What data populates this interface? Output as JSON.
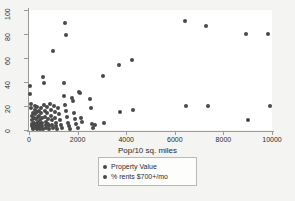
{
  "chart_data": {
    "type": "scatter",
    "title": "",
    "xlabel": "Pop/10 sq. miles",
    "ylabel": "",
    "xlim": [
      0,
      10000
    ],
    "ylim": [
      0,
      100
    ],
    "xticks": [
      0,
      2000,
      4000,
      6000,
      8000,
      10000
    ],
    "yticks": [
      0,
      20,
      40,
      60,
      80,
      100
    ],
    "grid": false,
    "legend_position": "bottom-center",
    "marker_color": "#494949",
    "series": [
      {
        "name": "Property Value",
        "points": [
          [
            40,
            37
          ],
          [
            60,
            30
          ],
          [
            90,
            22
          ],
          [
            100,
            18
          ],
          [
            110,
            12
          ],
          [
            120,
            8
          ],
          [
            130,
            5
          ],
          [
            140,
            3
          ],
          [
            150,
            2
          ],
          [
            160,
            1
          ],
          [
            180,
            14
          ],
          [
            190,
            10
          ],
          [
            200,
            6
          ],
          [
            210,
            4
          ],
          [
            220,
            2
          ],
          [
            240,
            20
          ],
          [
            250,
            17
          ],
          [
            260,
            13
          ],
          [
            270,
            9
          ],
          [
            280,
            5
          ],
          [
            300,
            3
          ],
          [
            310,
            1
          ],
          [
            330,
            19
          ],
          [
            340,
            15
          ],
          [
            350,
            11
          ],
          [
            360,
            7
          ],
          [
            380,
            4
          ],
          [
            390,
            2
          ],
          [
            410,
            16
          ],
          [
            420,
            12
          ],
          [
            440,
            8
          ],
          [
            450,
            5
          ],
          [
            460,
            3
          ],
          [
            470,
            1
          ],
          [
            490,
            18
          ],
          [
            500,
            14
          ],
          [
            520,
            10
          ],
          [
            530,
            6
          ],
          [
            550,
            3
          ],
          [
            560,
            1
          ],
          [
            580,
            44
          ],
          [
            600,
            39
          ],
          [
            620,
            21
          ],
          [
            640,
            16
          ],
          [
            660,
            11
          ],
          [
            680,
            7
          ],
          [
            700,
            4
          ],
          [
            720,
            2
          ],
          [
            740,
            19
          ],
          [
            760,
            14
          ],
          [
            780,
            9
          ],
          [
            800,
            5
          ],
          [
            820,
            3
          ],
          [
            840,
            1
          ],
          [
            870,
            22
          ],
          [
            900,
            17
          ],
          [
            920,
            12
          ],
          [
            940,
            8
          ],
          [
            960,
            4
          ],
          [
            980,
            2
          ],
          [
            1000,
            66
          ],
          [
            1020,
            20
          ],
          [
            1050,
            15
          ],
          [
            1080,
            10
          ],
          [
            1100,
            6
          ],
          [
            1130,
            3
          ],
          [
            1160,
            1
          ],
          [
            1200,
            18
          ],
          [
            1240,
            13
          ],
          [
            1280,
            8
          ],
          [
            1320,
            4
          ],
          [
            1360,
            2
          ],
          [
            1420,
            39
          ],
          [
            1450,
            28
          ],
          [
            1480,
            21
          ],
          [
            1500,
            89
          ],
          [
            1520,
            79
          ],
          [
            1540,
            16
          ],
          [
            1560,
            11
          ],
          [
            1600,
            6
          ],
          [
            1640,
            3
          ],
          [
            1680,
            1
          ],
          [
            1750,
            27
          ],
          [
            1800,
            24
          ],
          [
            1850,
            14
          ],
          [
            1900,
            9
          ],
          [
            1950,
            5
          ],
          [
            2000,
            2
          ],
          [
            2050,
            32
          ],
          [
            2100,
            31
          ],
          [
            2150,
            10
          ],
          [
            2200,
            7
          ],
          [
            2500,
            26
          ],
          [
            2550,
            18
          ],
          [
            2600,
            5
          ],
          [
            2620,
            2
          ],
          [
            2700,
            4
          ],
          [
            3050,
            45
          ],
          [
            3100,
            6
          ],
          [
            3700,
            54
          ],
          [
            3750,
            15
          ],
          [
            4250,
            58
          ],
          [
            4300,
            17
          ],
          [
            6400,
            91
          ],
          [
            6450,
            20
          ],
          [
            7300,
            87
          ],
          [
            7350,
            20
          ],
          [
            8950,
            80
          ],
          [
            9000,
            8
          ],
          [
            9850,
            80
          ],
          [
            9900,
            20
          ]
        ]
      },
      {
        "name": "% rents $700+/mo",
        "points": []
      }
    ]
  },
  "legend": {
    "items": [
      {
        "label": "Property Value"
      },
      {
        "label": "% rents $700+/mo"
      }
    ]
  },
  "axes": {
    "x_title": "Pop/10 sq. miles",
    "x_tick_labels": [
      "0",
      "2000",
      "4000",
      "6000",
      "8000",
      "10000"
    ],
    "y_tick_labels": [
      "0",
      "20",
      "40",
      "60",
      "80",
      "100"
    ]
  }
}
